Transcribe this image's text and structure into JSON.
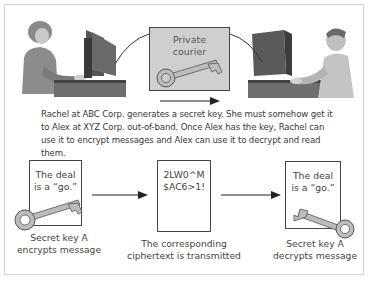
{
  "top_panel": {
    "courier_box": {
      "label": "Private\ncourier",
      "icon": "key-icon"
    },
    "left_person": "Rachel at computer",
    "right_person": "Alex at computer",
    "caption": "Rachel at ABC Corp. generates a secret key. She must somehow get it to Alex at XYZ Corp. out-of-band. Once Alex has the key, Rachel can use it to encrypt messages and Alex can use it to decrypt and read them."
  },
  "bottom_panel": {
    "steps": [
      {
        "box_text": "The deal\nis a “go.”",
        "label": "Secret key A\nencrypts message",
        "icon": "key-icon"
      },
      {
        "box_text": "2LW0^M\n$AC6>1!",
        "label": "The corresponding\nciphertext is transmitted"
      },
      {
        "box_text": "The deal\nis a “go.”",
        "label": "Secret key A\ndecrypts message",
        "icon": "key-icon"
      }
    ]
  },
  "colors": {
    "frame_border": "#d4d4d4",
    "courier_fill": "#cfcfcf",
    "box_border": "#444444",
    "key_fill": "#b8b8b8"
  }
}
